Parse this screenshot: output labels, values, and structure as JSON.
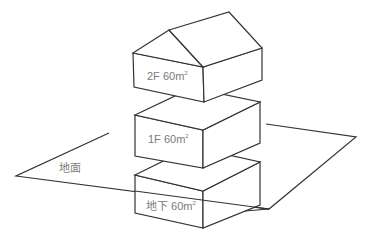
{
  "diagram": {
    "type": "isometric building floors",
    "ground_label": "地面",
    "floors": [
      {
        "id": "2F",
        "label": "2F 60m",
        "superscript": "2",
        "has_roof": true
      },
      {
        "id": "1F",
        "label": "1F 60m",
        "superscript": "2",
        "has_roof": false
      },
      {
        "id": "B1",
        "label": "地下 60m",
        "superscript": "2",
        "has_roof": false
      }
    ]
  },
  "colors": {
    "stroke": "#333333",
    "text": "#7a7a7a",
    "background": "#ffffff"
  }
}
